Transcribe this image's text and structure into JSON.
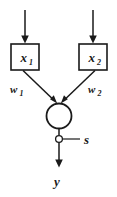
{
  "diagram": {
    "background_color": "#ffffff",
    "stroke_color": "#1a1a1a",
    "inputs": [
      {
        "id": "input-1",
        "base": "x",
        "subscript": "1",
        "weight_base": "w",
        "weight_subscript": "1"
      },
      {
        "id": "input-2",
        "base": "x",
        "subscript": "2",
        "weight_base": "w",
        "weight_subscript": "2"
      }
    ],
    "summation_node": {
      "id": "summation-circle",
      "label": ""
    },
    "threshold": {
      "id": "threshold-input",
      "label": "s"
    },
    "output": {
      "id": "output-signal",
      "label": "y"
    }
  }
}
